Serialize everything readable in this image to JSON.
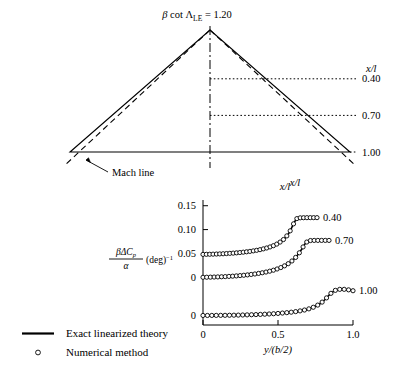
{
  "figure": {
    "title": "β cot ΛLE = 1.20",
    "title_parts": {
      "beta": "β",
      "cot": "cot",
      "lambda": "Λ",
      "sub": "LE",
      "eq": "= 1.20"
    }
  },
  "planform": {
    "station_label": "x/l",
    "bottom_axis_label": "x/l",
    "mach_line_label": "Mach line",
    "stations": [
      {
        "label": "0.40",
        "xl": 0.4
      },
      {
        "label": "0.70",
        "xl": 0.7
      },
      {
        "label": "1.00",
        "xl": 1.0
      }
    ]
  },
  "legend": {
    "items": [
      {
        "symbol": "line",
        "label": "Exact linearized theory"
      },
      {
        "symbol": "circle",
        "label": "Numerical method"
      }
    ]
  },
  "chart_data": {
    "type": "line",
    "title": "x/l",
    "xlabel": "y/(b/2)",
    "ylabel": "βΔCp/α (deg)⁻¹",
    "ylabel_parts": {
      "numerator": "βΔC",
      "numerator_sub": "p",
      "denominator": "α",
      "suffix": "(deg)",
      "suffix_sup": "−1"
    },
    "grid": false,
    "legend_position": "below-left",
    "xlim": [
      0,
      1.0
    ],
    "xticks": [
      0,
      0.5,
      1.0
    ],
    "xticklabels": [
      "0",
      "0.5",
      "1.0"
    ],
    "yticks": [
      0.15,
      0.1,
      0.05,
      0,
      0
    ],
    "yticklabels": [
      "0.15",
      "0.10",
      "0.05",
      "0",
      "0"
    ],
    "ytick_values": [
      0.15,
      0.1,
      0.05,
      0.0,
      -0.08
    ],
    "ylim": [
      -0.1,
      0.162
    ],
    "series": [
      {
        "name": "0.40",
        "annotation": "0.40",
        "baseline": 0.048,
        "x": [
          0.0,
          0.02,
          0.05,
          0.08,
          0.11,
          0.14,
          0.17,
          0.2,
          0.23,
          0.26,
          0.29,
          0.32,
          0.35,
          0.38,
          0.41,
          0.44,
          0.47,
          0.5,
          0.53,
          0.55,
          0.57,
          0.58,
          0.59,
          0.6,
          0.61,
          0.62,
          0.625,
          0.63,
          0.645,
          0.66,
          0.68,
          0.7,
          0.72,
          0.74,
          0.76
        ],
        "y": [
          0.048,
          0.0481,
          0.0483,
          0.0486,
          0.049,
          0.0494,
          0.05,
          0.0506,
          0.0514,
          0.0523,
          0.0534,
          0.0546,
          0.0561,
          0.0579,
          0.0601,
          0.0628,
          0.0663,
          0.0708,
          0.0772,
          0.0832,
          0.0912,
          0.0966,
          0.103,
          0.1098,
          0.116,
          0.1208,
          0.1228,
          0.124,
          0.1246,
          0.1248,
          0.1249,
          0.125,
          0.125,
          0.125,
          0.125
        ]
      },
      {
        "name": "0.70",
        "annotation": "0.70",
        "baseline": 0.0,
        "x": [
          0.0,
          0.02,
          0.05,
          0.08,
          0.11,
          0.14,
          0.17,
          0.2,
          0.23,
          0.26,
          0.29,
          0.32,
          0.35,
          0.38,
          0.41,
          0.44,
          0.47,
          0.5,
          0.53,
          0.56,
          0.59,
          0.62,
          0.64,
          0.66,
          0.67,
          0.68,
          0.69,
          0.7,
          0.705,
          0.715,
          0.73,
          0.75,
          0.78,
          0.81,
          0.84
        ],
        "y": [
          0.0,
          0.0001,
          0.0003,
          0.0006,
          0.0009,
          0.0013,
          0.0018,
          0.0024,
          0.0031,
          0.0039,
          0.0048,
          0.0059,
          0.0071,
          0.0086,
          0.0103,
          0.0124,
          0.0149,
          0.018,
          0.0218,
          0.0267,
          0.0333,
          0.0424,
          0.0502,
          0.0598,
          0.0652,
          0.07,
          0.0735,
          0.0757,
          0.0765,
          0.077,
          0.0772,
          0.0773,
          0.0773,
          0.0773,
          0.0773
        ]
      },
      {
        "name": "1.00",
        "annotation": "1.00",
        "baseline": -0.08,
        "x": [
          0.0,
          0.03,
          0.07,
          0.11,
          0.15,
          0.19,
          0.23,
          0.27,
          0.31,
          0.35,
          0.39,
          0.43,
          0.47,
          0.51,
          0.55,
          0.59,
          0.63,
          0.67,
          0.7,
          0.73,
          0.76,
          0.785,
          0.805,
          0.82,
          0.835,
          0.85,
          0.865,
          0.88,
          0.9,
          0.92,
          0.94,
          0.96,
          0.98,
          1.0
        ],
        "y": [
          -0.08,
          -0.08,
          -0.0799,
          -0.0798,
          -0.0797,
          -0.0795,
          -0.0793,
          -0.079,
          -0.0786,
          -0.0782,
          -0.0777,
          -0.0771,
          -0.0764,
          -0.0755,
          -0.0744,
          -0.0731,
          -0.0714,
          -0.0691,
          -0.0668,
          -0.0636,
          -0.0592,
          -0.0544,
          -0.0492,
          -0.0444,
          -0.0392,
          -0.0344,
          -0.0304,
          -0.0276,
          -0.0256,
          -0.025,
          -0.0252,
          -0.0258,
          -0.0268,
          -0.0282
        ]
      }
    ]
  }
}
